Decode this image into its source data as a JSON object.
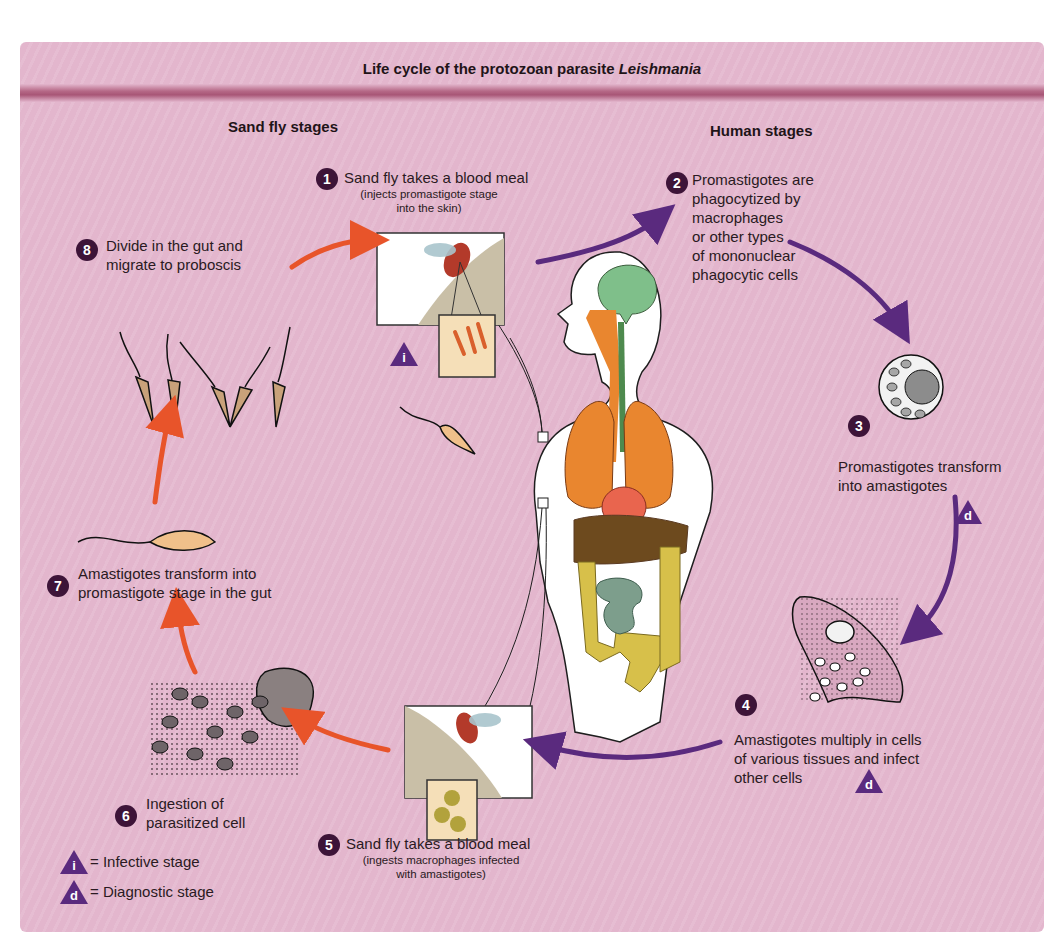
{
  "title": {
    "prefix": "Life cycle of the protozoan parasite ",
    "organism": "Leishmania"
  },
  "sections": {
    "left": "Sand fly stages",
    "right": "Human stages"
  },
  "colors": {
    "background": "#e3b6cd",
    "band": "#a85676",
    "step_badge": "#3d1438",
    "sand_fly_arrow": "#e8542a",
    "human_arrow": "#5a2a7e",
    "stage_marker": "#5a2a7e"
  },
  "steps": [
    {
      "n": "1",
      "label": "Sand fly takes a blood meal",
      "sub": [
        "(injects promastigote stage",
        "into the skin)"
      ],
      "marker": "i"
    },
    {
      "n": "2",
      "lines": [
        "Promastigotes are",
        "phagocytized by",
        "macrophages",
        "or other types",
        "of mononuclear",
        "phagocytic cells"
      ]
    },
    {
      "n": "3",
      "lines": [
        "Promastigotes transform",
        "into amastigotes"
      ],
      "marker": "d"
    },
    {
      "n": "4",
      "lines": [
        "Amastigotes multiply in cells",
        "of various tissues and infect",
        "other cells"
      ],
      "marker": "d"
    },
    {
      "n": "5",
      "label": "Sand fly takes a blood meal",
      "sub": [
        "(ingests macrophages infected",
        "with amastigotes)"
      ]
    },
    {
      "n": "6",
      "lines": [
        "Ingestion of",
        "parasitized cell"
      ]
    },
    {
      "n": "7",
      "lines": [
        "Amastigotes transform into",
        "promastigote stage in the gut"
      ]
    },
    {
      "n": "8",
      "lines": [
        "Divide in the gut and",
        "migrate to proboscis"
      ]
    }
  ],
  "legend": [
    {
      "symbol": "i",
      "label": "= Infective stage"
    },
    {
      "symbol": "d",
      "label": "= Diagnostic stage"
    }
  ]
}
